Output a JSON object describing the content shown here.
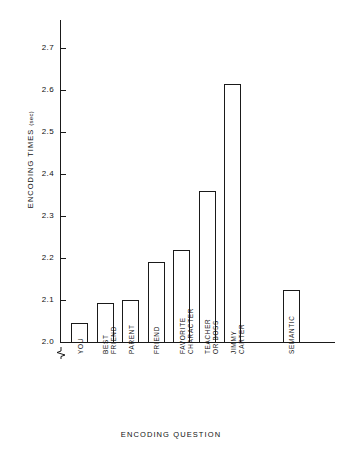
{
  "chart_data": {
    "type": "bar",
    "title": "",
    "xlabel": "ENCODING QUESTION",
    "ylabel": "ENCODING TIMES (sec)",
    "ylabel_main": "ENCODING TIMES",
    "ylabel_unit": "(sec)",
    "categories": [
      "YOU",
      "BEST FRIEND",
      "PARENT",
      "FRIEND",
      "FAVORITE CHARACTER",
      "TEACHER OR BOSS",
      "JIMMY CARTER",
      "SEMANTIC"
    ],
    "category_lines": [
      [
        "YOU"
      ],
      [
        "BEST",
        "FRIEND"
      ],
      [
        "PARENT"
      ],
      [
        "FRIEND"
      ],
      [
        "FAVORITE",
        "CHARACTER"
      ],
      [
        "TEACHER",
        "OR BOSS"
      ],
      [
        "JIMMY",
        "CARTER"
      ],
      [
        "SEMANTIC"
      ]
    ],
    "values": [
      2.045,
      2.093,
      2.1,
      2.19,
      2.22,
      2.36,
      2.615,
      2.125
    ],
    "ylim": [
      1.98,
      2.73
    ],
    "yticks": [
      2.0,
      2.1,
      2.2,
      2.3,
      2.4,
      2.5,
      2.6,
      2.7
    ],
    "ytick_labels": [
      "2.0",
      "2.1",
      "2.2",
      "2.3",
      "2.4",
      "2.5",
      "2.6",
      "2.7"
    ],
    "axis_break": true,
    "axis_break_note": "y-axis broken below 2.0",
    "grid": false,
    "legend": "none",
    "bar_style": "open outline",
    "bar_color": "#ffffff",
    "bar_edge_color": "#1a1a1a",
    "axis_color": "#1a1a1a",
    "group_gap_after_index": 6
  }
}
